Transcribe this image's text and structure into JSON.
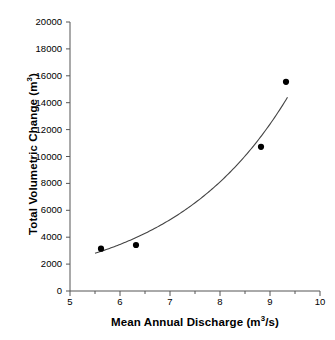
{
  "figure": {
    "background": "#ffffff",
    "marker_color": "#000000",
    "curve_color": "#444444",
    "axis_color": "#555555"
  },
  "axes": {
    "x": {
      "title_main": "Mean Annual Discharge (m",
      "title_sup": "3",
      "title_tail": "/s)",
      "min": 5,
      "max": 10,
      "major_ticks": [
        5,
        6,
        7,
        8,
        9,
        10
      ],
      "minor_ticks": [
        5.5,
        6.5,
        7.5,
        8.5,
        9.5
      ],
      "tick_labels": [
        "5",
        "6",
        "7",
        "8",
        "9",
        "10"
      ]
    },
    "y": {
      "title_main": "Total Volumetric Change (m",
      "title_sup": "3",
      "title_tail": ")",
      "min": 0,
      "max": 20000,
      "major_ticks": [
        0,
        2000,
        4000,
        6000,
        8000,
        10000,
        12000,
        14000,
        16000,
        18000,
        20000
      ],
      "tick_labels": [
        "0",
        "2000",
        "4000",
        "6000",
        "8000",
        "10000",
        "12000",
        "14000",
        "16000",
        "18000",
        "20000"
      ]
    }
  },
  "chart_data": {
    "type": "scatter",
    "title": "",
    "xlabel": "Mean Annual Discharge (m3/s)",
    "ylabel": "Total Volumetric Change (m3)",
    "xlim": [
      5,
      10
    ],
    "ylim": [
      0,
      20000
    ],
    "grid": false,
    "legend": "none",
    "series": [
      {
        "name": "Total Volumetric Change",
        "marker": "filled-circle",
        "x": [
          5.62,
          6.32,
          8.82,
          9.32
        ],
        "y": [
          3150,
          3420,
          10720,
          15550
        ]
      }
    ],
    "fit_curve": {
      "name": "exponential trendline",
      "type": "exponential",
      "x_start": 5.5,
      "x_end": 9.35,
      "x": [
        5.5,
        5.75,
        6.0,
        6.25,
        6.5,
        6.75,
        7.0,
        7.25,
        7.5,
        7.75,
        8.0,
        8.25,
        8.5,
        8.75,
        9.0,
        9.35
      ],
      "y": [
        2800,
        3180,
        3620,
        4120,
        4690,
        5340,
        6080,
        6920,
        7880,
        8970,
        10210,
        11620,
        13230,
        15060,
        17150,
        14400
      ]
    }
  }
}
